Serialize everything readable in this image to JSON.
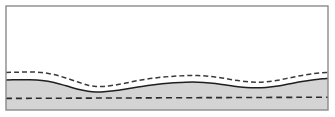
{
  "figure": {
    "canvas": {
      "width": 335,
      "height": 117
    },
    "frame": {
      "name": "plot-frame",
      "x": 6,
      "y": 6,
      "width": 322,
      "height": 104,
      "stroke_color": "#8a8a8a",
      "stroke_width": 1.4,
      "fill_color": "#ffffff"
    },
    "layers": {
      "upper_region": {
        "label": "unshaded upper region",
        "fill_color": "#ffffff"
      },
      "lower_region": {
        "label": "shaded lower layer",
        "fill_color": "#d4d4d4"
      }
    },
    "curves": [
      {
        "name": "upper-dashed-curve",
        "style": "dashed",
        "stroke_color": "#3a3a3a",
        "stroke_width": 1.5,
        "dash_pattern": "5,3",
        "points": [
          [
            6,
            72.5
          ],
          [
            18,
            72.2
          ],
          [
            30,
            72.0
          ],
          [
            42,
            72.6
          ],
          [
            54,
            74.6
          ],
          [
            66,
            78.0
          ],
          [
            78,
            82.0
          ],
          [
            88,
            85.2
          ],
          [
            96,
            86.4
          ],
          [
            104,
            86.4
          ],
          [
            114,
            85.2
          ],
          [
            126,
            83.0
          ],
          [
            138,
            80.6
          ],
          [
            150,
            78.6
          ],
          [
            162,
            77.2
          ],
          [
            174,
            76.2
          ],
          [
            186,
            75.6
          ],
          [
            198,
            75.6
          ],
          [
            210,
            76.4
          ],
          [
            222,
            78.0
          ],
          [
            234,
            80.0
          ],
          [
            246,
            81.6
          ],
          [
            256,
            82.2
          ],
          [
            266,
            81.8
          ],
          [
            278,
            80.2
          ],
          [
            290,
            77.8
          ],
          [
            302,
            75.4
          ],
          [
            314,
            73.6
          ],
          [
            322,
            72.7
          ],
          [
            328,
            72.4
          ]
        ]
      },
      {
        "name": "interface-solid-curve",
        "style": "solid",
        "stroke_color": "#1f1f1f",
        "stroke_width": 1.5,
        "points": [
          [
            6,
            80.0
          ],
          [
            18,
            79.8
          ],
          [
            30,
            79.8
          ],
          [
            42,
            80.6
          ],
          [
            54,
            82.6
          ],
          [
            66,
            85.8
          ],
          [
            78,
            89.2
          ],
          [
            88,
            91.2
          ],
          [
            96,
            92.0
          ],
          [
            104,
            91.8
          ],
          [
            114,
            90.8
          ],
          [
            126,
            89.0
          ],
          [
            138,
            87.0
          ],
          [
            150,
            85.2
          ],
          [
            162,
            83.8
          ],
          [
            174,
            82.8
          ],
          [
            186,
            82.2
          ],
          [
            198,
            82.2
          ],
          [
            210,
            83.0
          ],
          [
            222,
            84.4
          ],
          [
            234,
            86.2
          ],
          [
            246,
            87.4
          ],
          [
            256,
            87.8
          ],
          [
            266,
            87.4
          ],
          [
            278,
            86.0
          ],
          [
            290,
            83.8
          ],
          [
            302,
            81.6
          ],
          [
            314,
            79.8
          ],
          [
            322,
            78.8
          ],
          [
            328,
            78.4
          ]
        ]
      },
      {
        "name": "datum-dashed-line",
        "style": "dashed",
        "stroke_color": "#2b2b2b",
        "stroke_width": 1.6,
        "dash_pattern": "6,4",
        "points": [
          [
            6,
            98.4
          ],
          [
            328,
            97.2
          ]
        ]
      }
    ]
  }
}
